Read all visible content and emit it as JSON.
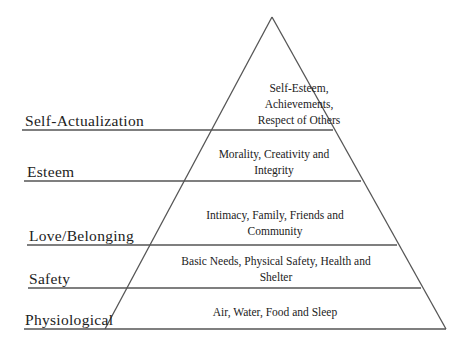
{
  "diagram": {
    "levels": [
      {
        "name": "Self-Actualization",
        "description": [
          "Self-Esteem,",
          "Achievements,",
          "Respect of Others"
        ]
      },
      {
        "name": "Esteem",
        "description": [
          "Morality, Creativity and",
          "Integrity"
        ]
      },
      {
        "name": "Love/Belonging",
        "description": [
          "Intimacy, Family, Friends and",
          "Community"
        ]
      },
      {
        "name": "Safety",
        "description": [
          "Basic Needs, Physical Safety, Health and",
          "Shelter"
        ]
      },
      {
        "name": "Physiological",
        "description": [
          "Air, Water, Food and Sleep"
        ]
      }
    ],
    "colors": {
      "line": "#555555",
      "text": "#222222",
      "background": "#ffffff"
    }
  }
}
